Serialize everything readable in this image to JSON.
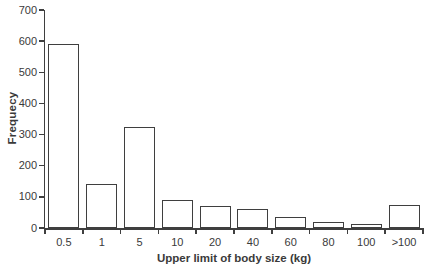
{
  "figure": {
    "background": "#ffffff",
    "line_color": "#3f3f3f",
    "text_color": "#3a3a3a",
    "bar_fill": "#ffffff"
  },
  "chart_data": {
    "type": "bar",
    "title": "",
    "xlabel": "Upper limit of body size (kg)",
    "ylabel": "Frequecy",
    "categories": [
      "0.5",
      "1",
      "5",
      "10",
      "20",
      "40",
      "60",
      "80",
      "100",
      ">100"
    ],
    "values": [
      590,
      140,
      325,
      90,
      72,
      60,
      34,
      18,
      12,
      74
    ],
    "ylim": [
      0,
      700
    ],
    "yticks": [
      0,
      100,
      200,
      300,
      400,
      500,
      600,
      700
    ],
    "grid": false,
    "legend": "none",
    "bar_style": "white fill, dark gray outline"
  }
}
